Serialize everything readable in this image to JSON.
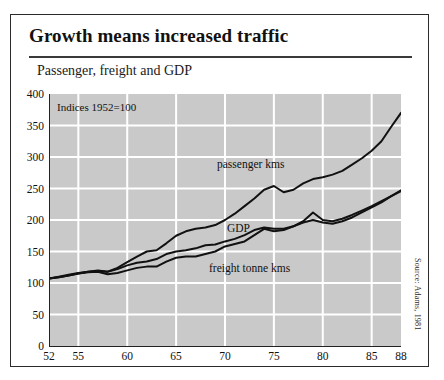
{
  "figure": {
    "title": "Growth means increased traffic",
    "subtitle": "Passenger, freight and GDP",
    "annotation": "Indices 1952=100",
    "source": "Source: Adams, 1981"
  },
  "labels": {
    "passenger": "passenger kms",
    "gdp": "GDP",
    "freight": "freight tonne kms"
  },
  "chart_data": {
    "type": "line",
    "title": "Growth means increased traffic",
    "subtitle": "Passenger, freight and GDP",
    "annotation": "Indices 1952=100",
    "source": "Source: Adams, 1981",
    "xlabel": "",
    "ylabel": "",
    "xlim": [
      52,
      88
    ],
    "ylim": [
      0,
      400
    ],
    "grid": true,
    "legend_position": "inline-annotations",
    "xticks": [
      52,
      55,
      60,
      65,
      70,
      75,
      80,
      85,
      88
    ],
    "yticks": [
      0,
      50,
      100,
      150,
      200,
      250,
      300,
      350,
      400
    ],
    "x": [
      52,
      53,
      54,
      55,
      56,
      57,
      58,
      59,
      60,
      61,
      62,
      63,
      64,
      65,
      66,
      67,
      68,
      69,
      70,
      71,
      72,
      73,
      74,
      75,
      76,
      77,
      78,
      79,
      80,
      81,
      82,
      83,
      84,
      85,
      86,
      87,
      88
    ],
    "series": [
      {
        "name": "passenger kms",
        "values": [
          107,
          109,
          112,
          115,
          118,
          120,
          118,
          124,
          133,
          142,
          150,
          152,
          163,
          175,
          182,
          186,
          188,
          192,
          200,
          210,
          222,
          234,
          248,
          254,
          244,
          248,
          258,
          265,
          268,
          272,
          278,
          288,
          298,
          310,
          325,
          348,
          370
        ]
      },
      {
        "name": "GDP",
        "values": [
          107,
          110,
          113,
          116,
          118,
          119,
          118,
          122,
          128,
          132,
          134,
          138,
          146,
          150,
          152,
          155,
          160,
          161,
          166,
          170,
          176,
          184,
          188,
          186,
          186,
          190,
          196,
          200,
          196,
          194,
          198,
          204,
          212,
          220,
          228,
          238,
          247
        ]
      },
      {
        "name": "freight tonne kms",
        "values": [
          107,
          109,
          112,
          115,
          117,
          118,
          114,
          116,
          120,
          124,
          126,
          126,
          134,
          140,
          142,
          142,
          146,
          150,
          158,
          162,
          166,
          176,
          186,
          182,
          184,
          190,
          198,
          212,
          200,
          198,
          202,
          208,
          215,
          222,
          230,
          238,
          246
        ]
      }
    ]
  }
}
